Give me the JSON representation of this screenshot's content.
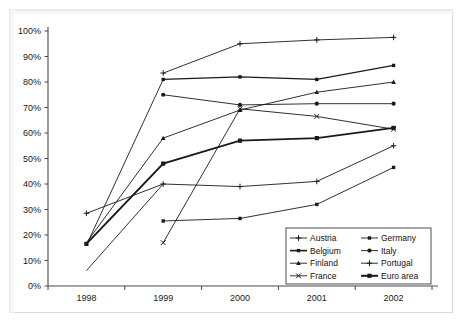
{
  "figure": {
    "background_color": "#ffffff",
    "frame_color": "#d8d8d8",
    "line_color": "#1a1a1a",
    "axis_color": "#4a4a4a"
  },
  "chart_data": {
    "type": "line",
    "title": "",
    "xlabel": "",
    "ylabel": "",
    "x": [
      "1998",
      "1999",
      "2000",
      "2001",
      "2002"
    ],
    "categories": [
      "1998",
      "1999",
      "2000",
      "2001",
      "2002"
    ],
    "ylim": [
      0,
      100
    ],
    "ytick_labels": [
      "0%",
      "10%",
      "20%",
      "30%",
      "40%",
      "50%",
      "60%",
      "70%",
      "80%",
      "90%",
      "100%"
    ],
    "ytick_values": [
      0,
      10,
      20,
      30,
      40,
      50,
      60,
      70,
      80,
      90,
      100
    ],
    "grid": false,
    "legend_position": "bottom-right",
    "legend_columns": 2,
    "series": [
      {
        "name": "Austria",
        "marker": "plus",
        "stroke_width": 0.9,
        "values": [
          null,
          83.5,
          95.0,
          96.5,
          97.5
        ]
      },
      {
        "name": "Belgium",
        "marker": "square",
        "stroke_width": 1.2,
        "values": [
          null,
          81.0,
          82.0,
          81.0,
          86.5
        ]
      },
      {
        "name": "Finland",
        "marker": "triangle",
        "stroke_width": 0.9,
        "values": [
          null,
          58.0,
          69.0,
          76.0,
          80.0
        ]
      },
      {
        "name": "France",
        "marker": "x",
        "stroke_width": 0.9,
        "values": [
          null,
          17.0,
          69.5,
          66.5,
          61.5
        ]
      },
      {
        "name": "Germany",
        "marker": "square",
        "stroke_width": 0.9,
        "values": [
          null,
          25.5,
          26.5,
          32.0,
          46.5
        ]
      },
      {
        "name": "Italy",
        "marker": "circle",
        "stroke_width": 0.9,
        "values": [
          null,
          75.0,
          71.0,
          71.5,
          71.5
        ]
      },
      {
        "name": "Portugal",
        "marker": "plus",
        "stroke_width": 0.9,
        "values": [
          28.5,
          40.0,
          39.0,
          41.0,
          55.0
        ]
      },
      {
        "name": "Euro area",
        "marker": "square",
        "stroke_width": 1.9,
        "values": [
          16.5,
          48.0,
          57.0,
          58.0,
          62.0
        ]
      },
      {
        "name": "Unlabelled low start A",
        "marker": "none",
        "stroke_width": 0.9,
        "hidden_from_legend": true,
        "values": [
          17.0,
          58.0,
          null,
          null,
          null
        ]
      },
      {
        "name": "Unlabelled low start B",
        "marker": "none",
        "stroke_width": 0.9,
        "hidden_from_legend": true,
        "values": [
          16.0,
          81.0,
          null,
          null,
          null
        ]
      },
      {
        "name": "Unlabelled low start C",
        "marker": "none",
        "stroke_width": 0.9,
        "hidden_from_legend": true,
        "values": [
          6.0,
          40.0,
          null,
          null,
          null
        ]
      }
    ],
    "legend_entries": [
      {
        "label": "Austria",
        "marker": "plus",
        "stroke_width": 0.9
      },
      {
        "label": "Germany",
        "marker": "square",
        "stroke_width": 0.9
      },
      {
        "label": "Belgium",
        "marker": "square",
        "stroke_width": 1.6
      },
      {
        "label": "Italy",
        "marker": "circle",
        "stroke_width": 0.9
      },
      {
        "label": "Finland",
        "marker": "triangle",
        "stroke_width": 0.9
      },
      {
        "label": "Portugal",
        "marker": "plus",
        "stroke_width": 0.9
      },
      {
        "label": "France",
        "marker": "x",
        "stroke_width": 0.9
      },
      {
        "label": "Euro area",
        "marker": "square",
        "stroke_width": 2.0
      }
    ]
  }
}
